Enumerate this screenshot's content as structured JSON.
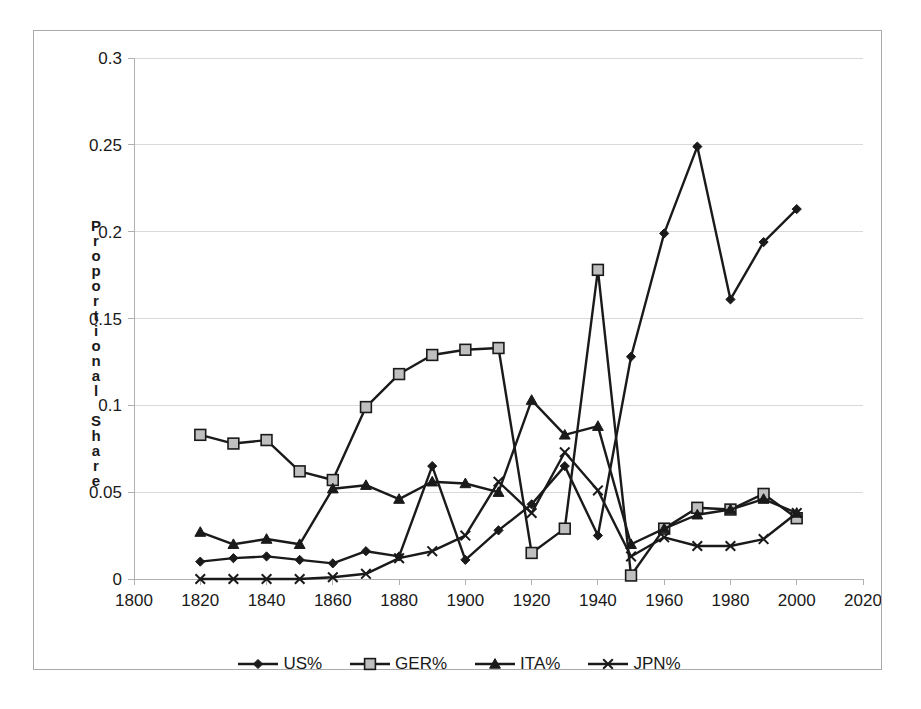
{
  "chart_data": {
    "type": "line",
    "title": "",
    "xlabel": "",
    "ylabel": "Proportional Share",
    "xlim": [
      1800,
      2020
    ],
    "ylim": [
      0,
      0.3
    ],
    "xticks": [
      1800,
      1820,
      1840,
      1860,
      1880,
      1900,
      1920,
      1940,
      1960,
      1980,
      2000,
      2020
    ],
    "yticks": [
      0,
      0.05,
      0.1,
      0.15,
      0.2,
      0.25,
      0.3
    ],
    "ytick_labels": [
      "0",
      "0.05",
      "0.1",
      "0.15",
      "0.2",
      "0.25",
      "0.3"
    ],
    "xtick_labels": [
      "1800",
      "1820",
      "1840",
      "1860",
      "1880",
      "1900",
      "1920",
      "1940",
      "1960",
      "1980",
      "2000",
      "2020"
    ],
    "grid": "horizontal",
    "legend_position": "bottom",
    "x": [
      1820,
      1830,
      1840,
      1850,
      1860,
      1870,
      1880,
      1890,
      1900,
      1910,
      1920,
      1930,
      1940,
      1950,
      1960,
      1970,
      1980,
      1990,
      2000
    ],
    "series": [
      {
        "name": "US%",
        "marker": "diamond",
        "color": "#1a1a1a",
        "values": [
          0.01,
          0.012,
          0.013,
          0.011,
          0.009,
          0.016,
          0.013,
          0.065,
          0.011,
          0.028,
          0.043,
          0.065,
          0.025,
          0.128,
          0.199,
          0.249,
          0.161,
          0.194,
          0.213
        ]
      },
      {
        "name": "GER%",
        "marker": "square",
        "color": "#1a1a1a",
        "values": [
          0.083,
          0.078,
          0.08,
          0.062,
          0.057,
          0.099,
          0.118,
          0.129,
          0.132,
          0.133,
          0.015,
          0.029,
          0.178,
          0.002,
          0.029,
          0.041,
          0.04,
          0.049,
          0.035
        ]
      },
      {
        "name": "ITA%",
        "marker": "triangle",
        "color": "#1a1a1a",
        "values": [
          0.027,
          0.02,
          0.023,
          0.02,
          0.052,
          0.054,
          0.046,
          0.056,
          0.055,
          0.05,
          0.103,
          0.083,
          0.088,
          0.02,
          0.029,
          0.037,
          0.04,
          0.046,
          0.038
        ]
      },
      {
        "name": "JPN%",
        "marker": "cross",
        "color": "#1a1a1a",
        "values": [
          0.0,
          0.0,
          0.0,
          0.0,
          0.001,
          0.003,
          0.012,
          0.016,
          0.025,
          0.056,
          0.038,
          0.073,
          0.051,
          0.013,
          0.024,
          0.019,
          0.019,
          0.023,
          0.038
        ]
      }
    ]
  },
  "axis": {
    "y_title": "Proportional Share",
    "y_title_letters": [
      "P",
      "r",
      "o",
      "p",
      "o",
      "r",
      "t",
      "i",
      "o",
      "n",
      "a",
      "l",
      " ",
      "S",
      "h",
      "a",
      "r",
      "e"
    ]
  },
  "legend": {
    "entries": [
      {
        "label": "US%",
        "marker": "diamond"
      },
      {
        "label": "GER%",
        "marker": "square"
      },
      {
        "label": "ITA%",
        "marker": "triangle"
      },
      {
        "label": "JPN%",
        "marker": "cross"
      }
    ]
  },
  "colors": {
    "line": "#1a1a1a",
    "grid": "#d9d9d9",
    "axis": "#b0b0b0",
    "square_fill": "#bfbfbf",
    "frame": "#a9a9a9",
    "background": "#ffffff"
  }
}
